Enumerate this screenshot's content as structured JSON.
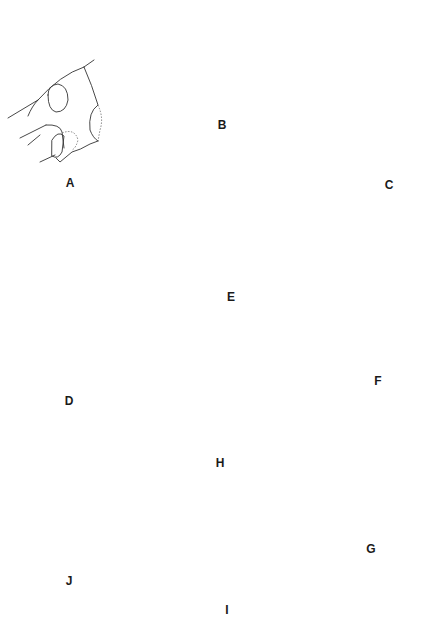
{
  "figure": {
    "panels": [
      {
        "id": "A",
        "label": "A",
        "view": "lateral head"
      },
      {
        "id": "B",
        "label": "B",
        "view": "lateral head"
      },
      {
        "id": "C",
        "label": "C",
        "view": "lateral head"
      },
      {
        "id": "D",
        "label": "D",
        "view": "dorsal head"
      },
      {
        "id": "E",
        "label": "E",
        "view": "lateral head"
      },
      {
        "id": "F",
        "label": "F",
        "view": "lateral head, compound eye"
      },
      {
        "id": "G",
        "label": "G",
        "view": "lateral head, compound eye"
      },
      {
        "id": "H",
        "label": "H",
        "view": "lateral head detail, compound eye"
      },
      {
        "id": "I",
        "label": "I",
        "view": "dorsal head tip, compound eye"
      },
      {
        "id": "J",
        "label": "J",
        "view": "lateral head, ocelli"
      }
    ],
    "colors": {
      "line": "#333333",
      "background": "#ffffff",
      "eye_fill": "#2a2a2a"
    }
  }
}
